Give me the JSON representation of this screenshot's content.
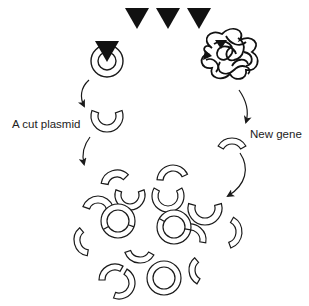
{
  "diagram": {
    "title_partial": "g",
    "labels": {
      "cut_plasmid": "A cut plasmid",
      "new_gene": "New gene"
    },
    "colors": {
      "stroke": "#1a1a1a",
      "fill": "#ffffff",
      "enzyme": "#111111",
      "text": "#222222"
    },
    "enzymes_top": [
      {
        "x": 137,
        "y": 8
      },
      {
        "x": 168,
        "y": 8
      },
      {
        "x": 199,
        "y": 8
      }
    ],
    "plasmid_intact": {
      "cx": 107,
      "cy": 61,
      "r_outer": 16,
      "r_inner": 9
    },
    "cut_plasmid": {
      "cx": 107,
      "cy": 116,
      "r_outer": 16,
      "r_inner": 9,
      "gap_start": -60,
      "gap_end": 240
    },
    "new_gene_fragment": {
      "cx": 232,
      "cy": 142,
      "r_outer": 16,
      "r_inner": 10,
      "from": -150,
      "to": -30
    },
    "mixture": {
      "fragments": [
        {
          "cx": 117,
          "cy": 186,
          "ro": 16,
          "ri": 9,
          "from": 190,
          "to": 315
        },
        {
          "cx": 98,
          "cy": 212,
          "ro": 16,
          "ri": 9,
          "from": 200,
          "to": 340
        },
        {
          "cx": 130,
          "cy": 195,
          "ro": 15,
          "ri": 9,
          "from": -20,
          "to": 200
        },
        {
          "cx": 173,
          "cy": 181,
          "ro": 16,
          "ri": 10,
          "from": 185,
          "to": 335
        },
        {
          "cx": 168,
          "cy": 196,
          "ro": 16,
          "ri": 10,
          "from": -30,
          "to": 210
        },
        {
          "cx": 205,
          "cy": 208,
          "ro": 17,
          "ri": 10,
          "from": -15,
          "to": 195
        },
        {
          "cx": 225,
          "cy": 232,
          "ro": 17,
          "ri": 11,
          "from": -60,
          "to": 70
        },
        {
          "cx": 90,
          "cy": 240,
          "ro": 16,
          "ri": 10,
          "from": 100,
          "to": 230
        },
        {
          "cx": 140,
          "cy": 247,
          "ro": 16,
          "ri": 10,
          "from": 30,
          "to": 160
        },
        {
          "cx": 190,
          "cy": 240,
          "ro": 16,
          "ri": 10,
          "from": -110,
          "to": 10
        },
        {
          "cx": 205,
          "cy": 270,
          "ro": 16,
          "ri": 10,
          "from": 120,
          "to": 230
        }
      ],
      "rings": [
        {
          "cx": 118,
          "cy": 221,
          "ro": 17,
          "ri": 11,
          "seams": [
            150,
            20
          ]
        },
        {
          "cx": 174,
          "cy": 227,
          "ro": 17,
          "ri": 11,
          "seams": [
            210,
            10
          ]
        },
        {
          "cx": 164,
          "cy": 278,
          "ro": 17,
          "ri": 11,
          "seams": []
        }
      ],
      "broken_rings": [
        {
          "cx": 178,
          "cy": 195,
          "ro": 16,
          "ri": 10,
          "note": "ring with seam"
        },
        {
          "cx": 115,
          "cy": 280,
          "ro": 16,
          "ri": 10,
          "note": "two-part ring"
        }
      ]
    }
  }
}
